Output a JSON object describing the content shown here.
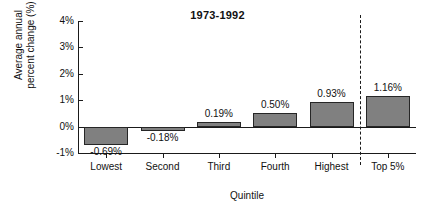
{
  "chart_data": {
    "type": "bar",
    "title": "1973-1992",
    "xlabel": "Quintile",
    "ylabel": "Average annual\npercent change (%)",
    "categories": [
      "Lowest",
      "Second",
      "Third",
      "Fourth",
      "Highest",
      "Top 5%"
    ],
    "values": [
      -0.69,
      -0.18,
      0.19,
      0.5,
      0.93,
      1.16
    ],
    "value_labels": [
      "-0.69%",
      "-0.18%",
      "0.19%",
      "0.50%",
      "0.93%",
      "1.16%"
    ],
    "ylim": [
      -1,
      4
    ],
    "yticks": [
      4,
      3,
      2,
      1,
      0,
      -1
    ],
    "ytick_labels": [
      "4%",
      "3%",
      "2%",
      "1%",
      "0%",
      "-1%"
    ],
    "grid": false,
    "legend": "none",
    "annotations": [
      {
        "name": "group-divider",
        "kind": "vertical-dashed-line",
        "between": [
          "Highest",
          "Top 5%"
        ]
      }
    ],
    "colors": {
      "bar_fill": "#808080",
      "bar_edge": "#262626",
      "axis": "#1a1a1a",
      "text": "#111111",
      "background": "#ffffff"
    }
  }
}
